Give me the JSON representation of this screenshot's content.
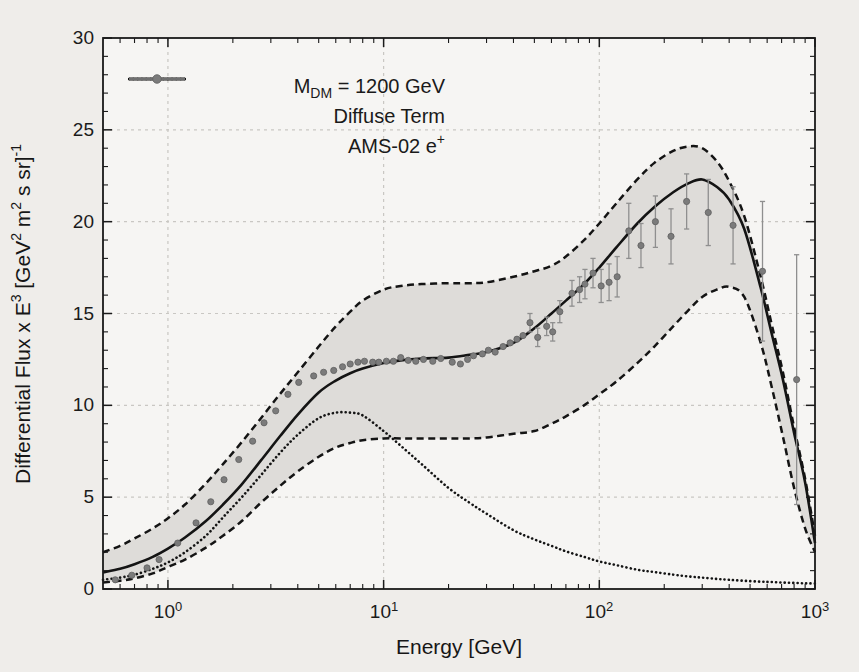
{
  "figure": {
    "bg_page": "#efedea",
    "bg_plot": "#f6f5f3",
    "band_fill": "#dedcd9",
    "grid_color": "#c9c7c3",
    "axis_color": "#1a1a1a",
    "line_color": "#141414",
    "marker_color": "#7b7b7b",
    "marker_edge": "#5f5f5f",
    "errorbar_color": "#8f8f8f"
  },
  "chart_data": {
    "type": "line",
    "title": "",
    "xlabel": "Energy [GeV]",
    "ylabel_segments": [
      {
        "t": "Differential Flux x E"
      },
      {
        "t": "3",
        "sup": true
      },
      {
        "t": " [GeV"
      },
      {
        "t": "2",
        "sup": true
      },
      {
        "t": " m"
      },
      {
        "t": "2",
        "sup": true
      },
      {
        "t": " s sr]"
      },
      {
        "t": "-1",
        "sup": true
      }
    ],
    "x_scale": "log",
    "xlim": [
      0.5,
      1000
    ],
    "ylim": [
      0,
      30
    ],
    "x_tick_exponents": [
      0,
      1,
      2,
      3
    ],
    "y_ticks": [
      0,
      5,
      10,
      15,
      20,
      25,
      30
    ],
    "grid": "light dashed lines at major ticks",
    "legend": [
      {
        "style": "solid-line",
        "segments": [
          {
            "t": "M"
          },
          {
            "t": "DM",
            "sub": true
          },
          {
            "t": " = 1200 GeV"
          }
        ]
      },
      {
        "style": "dotted-line",
        "segments": [
          {
            "t": "Diffuse Term"
          }
        ]
      },
      {
        "style": "marker-errorbar",
        "segments": [
          {
            "t": "AMS-02 e"
          },
          {
            "t": "+",
            "sup": true
          }
        ]
      }
    ],
    "series": [
      {
        "name": "MDM = 1200 GeV total model",
        "role": "total",
        "style": "solid",
        "points": [
          [
            0.5,
            0.9
          ],
          [
            0.6,
            1.1
          ],
          [
            0.7,
            1.35
          ],
          [
            0.85,
            1.75
          ],
          [
            1,
            2.2
          ],
          [
            1.2,
            2.8
          ],
          [
            1.5,
            3.7
          ],
          [
            1.8,
            4.6
          ],
          [
            2.2,
            5.7
          ],
          [
            2.7,
            7.0
          ],
          [
            3.3,
            8.3
          ],
          [
            4,
            9.5
          ],
          [
            5,
            10.7
          ],
          [
            6,
            11.35
          ],
          [
            7,
            11.75
          ],
          [
            8,
            12.0
          ],
          [
            10,
            12.3
          ],
          [
            12,
            12.45
          ],
          [
            15,
            12.55
          ],
          [
            20,
            12.6
          ],
          [
            25,
            12.75
          ],
          [
            30,
            12.9
          ],
          [
            40,
            13.4
          ],
          [
            50,
            14.2
          ],
          [
            60,
            15.0
          ],
          [
            70,
            15.7
          ],
          [
            85,
            16.6
          ],
          [
            100,
            17.5
          ],
          [
            120,
            18.6
          ],
          [
            150,
            19.9
          ],
          [
            180,
            20.8
          ],
          [
            220,
            21.6
          ],
          [
            260,
            22.1
          ],
          [
            300,
            22.3
          ],
          [
            350,
            21.9
          ],
          [
            400,
            21.2
          ],
          [
            470,
            19.6
          ],
          [
            560,
            16.4
          ],
          [
            630,
            13.9
          ],
          [
            710,
            11.4
          ],
          [
            800,
            8.5
          ],
          [
            900,
            5.8
          ],
          [
            1000,
            2.5
          ]
        ]
      },
      {
        "name": "Diffuse Term",
        "role": "diffuse",
        "style": "dotted",
        "points": [
          [
            0.5,
            0.5
          ],
          [
            0.6,
            0.62
          ],
          [
            0.7,
            0.78
          ],
          [
            0.85,
            1.1
          ],
          [
            1,
            1.45
          ],
          [
            1.2,
            2.0
          ],
          [
            1.5,
            2.9
          ],
          [
            1.8,
            3.9
          ],
          [
            2.2,
            5.0
          ],
          [
            2.7,
            6.2
          ],
          [
            3.3,
            7.4
          ],
          [
            4,
            8.4
          ],
          [
            5,
            9.3
          ],
          [
            6,
            9.6
          ],
          [
            7,
            9.6
          ],
          [
            8,
            9.45
          ],
          [
            10,
            8.6
          ],
          [
            12,
            7.8
          ],
          [
            15,
            6.8
          ],
          [
            20,
            5.5
          ],
          [
            25,
            4.7
          ],
          [
            30,
            4.1
          ],
          [
            40,
            3.2
          ],
          [
            50,
            2.7
          ],
          [
            60,
            2.35
          ],
          [
            70,
            2.05
          ],
          [
            85,
            1.75
          ],
          [
            100,
            1.5
          ],
          [
            120,
            1.3
          ],
          [
            150,
            1.05
          ],
          [
            180,
            0.92
          ],
          [
            220,
            0.78
          ],
          [
            260,
            0.68
          ],
          [
            300,
            0.62
          ],
          [
            350,
            0.55
          ],
          [
            400,
            0.5
          ],
          [
            470,
            0.45
          ],
          [
            560,
            0.4
          ],
          [
            630,
            0.38
          ],
          [
            710,
            0.35
          ],
          [
            800,
            0.33
          ],
          [
            900,
            0.31
          ],
          [
            1000,
            0.3
          ]
        ]
      },
      {
        "name": "Uncertainty band upper",
        "role": "band_upper",
        "style": "dashed",
        "points": [
          [
            0.5,
            2.0
          ],
          [
            0.6,
            2.35
          ],
          [
            0.7,
            2.75
          ],
          [
            0.85,
            3.3
          ],
          [
            1,
            3.85
          ],
          [
            1.2,
            4.6
          ],
          [
            1.5,
            5.75
          ],
          [
            1.8,
            6.8
          ],
          [
            2.2,
            8.0
          ],
          [
            2.7,
            9.3
          ],
          [
            3.3,
            10.6
          ],
          [
            4,
            11.8
          ],
          [
            5,
            13.2
          ],
          [
            6,
            14.3
          ],
          [
            7,
            15.1
          ],
          [
            8,
            15.7
          ],
          [
            10,
            16.3
          ],
          [
            12,
            16.5
          ],
          [
            15,
            16.6
          ],
          [
            20,
            16.65
          ],
          [
            25,
            16.65
          ],
          [
            30,
            16.7
          ],
          [
            40,
            17.0
          ],
          [
            50,
            17.3
          ],
          [
            60,
            17.6
          ],
          [
            70,
            18.1
          ],
          [
            85,
            19.0
          ],
          [
            100,
            19.9
          ],
          [
            120,
            21.0
          ],
          [
            150,
            22.3
          ],
          [
            180,
            23.2
          ],
          [
            220,
            23.85
          ],
          [
            260,
            24.1
          ],
          [
            300,
            24.0
          ],
          [
            350,
            23.3
          ],
          [
            400,
            22.2
          ],
          [
            470,
            20.3
          ],
          [
            560,
            17.0
          ],
          [
            630,
            14.4
          ],
          [
            710,
            11.8
          ],
          [
            800,
            8.8
          ],
          [
            900,
            6.0
          ],
          [
            1000,
            2.9
          ]
        ]
      },
      {
        "name": "Uncertainty band lower",
        "role": "band_lower",
        "style": "dashed",
        "points": [
          [
            0.5,
            0.35
          ],
          [
            0.6,
            0.45
          ],
          [
            0.7,
            0.58
          ],
          [
            0.85,
            0.85
          ],
          [
            1,
            1.2
          ],
          [
            1.2,
            1.6
          ],
          [
            1.5,
            2.25
          ],
          [
            1.8,
            2.9
          ],
          [
            2.2,
            3.7
          ],
          [
            2.7,
            4.7
          ],
          [
            3.3,
            5.6
          ],
          [
            4,
            6.4
          ],
          [
            5,
            7.2
          ],
          [
            6,
            7.7
          ],
          [
            7,
            7.95
          ],
          [
            8,
            8.1
          ],
          [
            10,
            8.2
          ],
          [
            12,
            8.2
          ],
          [
            15,
            8.2
          ],
          [
            20,
            8.2
          ],
          [
            25,
            8.2
          ],
          [
            30,
            8.25
          ],
          [
            40,
            8.45
          ],
          [
            50,
            8.6
          ],
          [
            60,
            9.0
          ],
          [
            70,
            9.4
          ],
          [
            85,
            10.0
          ],
          [
            100,
            10.6
          ],
          [
            120,
            11.3
          ],
          [
            150,
            12.3
          ],
          [
            180,
            13.2
          ],
          [
            220,
            14.3
          ],
          [
            260,
            15.2
          ],
          [
            300,
            15.9
          ],
          [
            350,
            16.3
          ],
          [
            400,
            16.45
          ],
          [
            470,
            15.9
          ],
          [
            560,
            13.4
          ],
          [
            630,
            11.0
          ],
          [
            710,
            8.3
          ],
          [
            800,
            5.5
          ],
          [
            900,
            3.3
          ],
          [
            1000,
            2.0
          ]
        ]
      }
    ],
    "scatter": {
      "name": "AMS-02 e+",
      "marker": "filled-circle",
      "points": [
        [
          0.57,
          0.5,
          0
        ],
        [
          0.68,
          0.75,
          0
        ],
        [
          0.8,
          1.15,
          0
        ],
        [
          0.91,
          1.6,
          0
        ],
        [
          1.11,
          2.5,
          0
        ],
        [
          1.35,
          3.6,
          0
        ],
        [
          1.58,
          4.75,
          0
        ],
        [
          1.82,
          5.95,
          0
        ],
        [
          2.13,
          7.05,
          0
        ],
        [
          2.47,
          8.05,
          0
        ],
        [
          2.79,
          9.05,
          0
        ],
        [
          3.16,
          9.7,
          0
        ],
        [
          3.6,
          10.6,
          0
        ],
        [
          4.04,
          11.25,
          0
        ],
        [
          4.74,
          11.6,
          0
        ],
        [
          5.27,
          11.8,
          0
        ],
        [
          5.87,
          11.9,
          0
        ],
        [
          6.45,
          12.1,
          0
        ],
        [
          7.0,
          12.25,
          0
        ],
        [
          7.6,
          12.35,
          0
        ],
        [
          8.15,
          12.4,
          0
        ],
        [
          8.9,
          12.35,
          0
        ],
        [
          9.5,
          12.35,
          0
        ],
        [
          10.3,
          12.4,
          0
        ],
        [
          11.1,
          12.4,
          0
        ],
        [
          12.0,
          12.6,
          0
        ],
        [
          13.0,
          12.45,
          0
        ],
        [
          14.1,
          12.4,
          0
        ],
        [
          15.3,
          12.5,
          0
        ],
        [
          16.9,
          12.4,
          0
        ],
        [
          18.4,
          12.55,
          0
        ],
        [
          20.8,
          12.35,
          0
        ],
        [
          22.7,
          12.25,
          0
        ],
        [
          24.5,
          12.5,
          0
        ],
        [
          26.1,
          12.7,
          0
        ],
        [
          28.7,
          12.8,
          0
        ],
        [
          30.6,
          13.0,
          0
        ],
        [
          32.9,
          12.9,
          0
        ],
        [
          35.8,
          13.2,
          0
        ],
        [
          38.6,
          13.4,
          0
        ],
        [
          41.5,
          13.6,
          0
        ],
        [
          44.3,
          13.8,
          0
        ],
        [
          47.7,
          14.5,
          0.5
        ],
        [
          51.8,
          13.7,
          0.5
        ],
        [
          57,
          14.3,
          0.5
        ],
        [
          60.8,
          14.0,
          0.5
        ],
        [
          65.6,
          15.1,
          0.6
        ],
        [
          74.7,
          16.1,
          0.7
        ],
        [
          81,
          16.3,
          0.7
        ],
        [
          85.8,
          16.6,
          0.8
        ],
        [
          93.5,
          17.2,
          0.8
        ],
        [
          102,
          16.5,
          0.9
        ],
        [
          111,
          16.7,
          1.0
        ],
        [
          121,
          17.0,
          1.1
        ],
        [
          137,
          19.5,
          1.5
        ],
        [
          156,
          18.7,
          1.2
        ],
        [
          182,
          20.0,
          1.4
        ],
        [
          215,
          19.2,
          1.5
        ],
        [
          254,
          21.1,
          1.5
        ],
        [
          320,
          20.5,
          1.8
        ],
        [
          417,
          19.8,
          2.1
        ],
        [
          571,
          17.3,
          3.8
        ],
        [
          822,
          11.4,
          6.8
        ]
      ]
    }
  }
}
